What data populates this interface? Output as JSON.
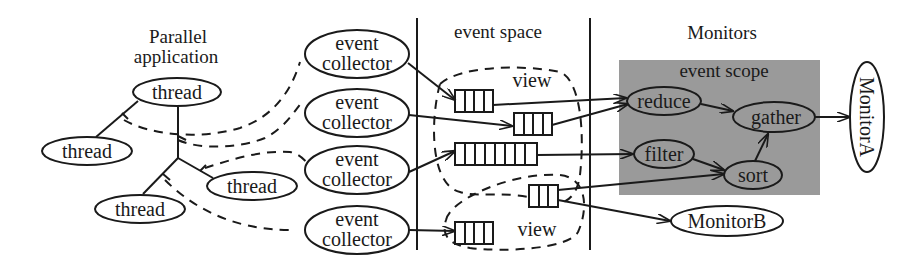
{
  "sections": {
    "parallel_application": {
      "line1": "Parallel",
      "line2": "application"
    },
    "event_space": "event space",
    "monitors": "Monitors"
  },
  "threads": [
    {
      "label": "thread"
    },
    {
      "label": "thread"
    },
    {
      "label": "thread"
    },
    {
      "label": "thread"
    }
  ],
  "collectors": [
    {
      "line1": "event",
      "line2": "collector"
    },
    {
      "line1": "event",
      "line2": "collector"
    },
    {
      "line1": "event",
      "line2": "collector"
    },
    {
      "line1": "event",
      "line2": "collector"
    }
  ],
  "views": [
    {
      "label": "view"
    },
    {
      "label": "view"
    }
  ],
  "queues": [
    {
      "cells": 4
    },
    {
      "cells": 4
    },
    {
      "cells": 8
    },
    {
      "cells": 3
    },
    {
      "cells": 4
    }
  ],
  "event_scope": {
    "title": "event scope",
    "background": "#9a9a9a",
    "nodes": {
      "reduce": "reduce",
      "gather": "gather",
      "filter": "filter",
      "sort": "sort"
    }
  },
  "monitor_a": "MonitorA",
  "monitor_b": "MonitorB"
}
